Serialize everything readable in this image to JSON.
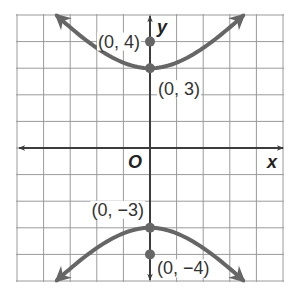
{
  "chart_data": {
    "type": "line",
    "title": "",
    "xlabel": "x",
    "ylabel": "y",
    "origin_label": "O",
    "xlim": [
      -5,
      5
    ],
    "ylim": [
      -5,
      5
    ],
    "grid": true,
    "grid_step": 1,
    "series": [
      {
        "name": "upper-branch",
        "shape": "hyperbola branch opening upward, vertex at (0, 3), arrows at both ends",
        "x_range": [
          -3.5,
          3.5
        ]
      },
      {
        "name": "lower-branch",
        "shape": "hyperbola branch opening downward, vertex at (0, -3), arrows at both ends",
        "x_range": [
          -3.5,
          3.5
        ]
      }
    ],
    "points": [
      {
        "x": 0,
        "y": 4,
        "label": "(0, 4)",
        "label_side": "left"
      },
      {
        "x": 0,
        "y": 3,
        "label": "(0, 3)",
        "label_side": "below-right"
      },
      {
        "x": 0,
        "y": -3,
        "label": "(0, −3)",
        "label_side": "above-left"
      },
      {
        "x": 0,
        "y": -4,
        "label": "(0, −4)",
        "label_side": "right"
      }
    ]
  },
  "colors": {
    "grid": "#9a9a9a",
    "axis": "#3c3c3c",
    "curve": "#666666",
    "point": "#666666"
  }
}
